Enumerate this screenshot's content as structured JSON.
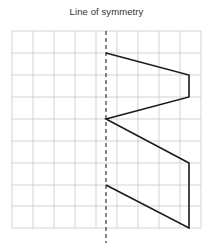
{
  "title": "Line of symmetry",
  "colors": {
    "grid": "#c8c8c8",
    "shape": "#1a1a1a",
    "symmetry_line": "#222222",
    "background": "#ffffff",
    "title_text": "#333333"
  },
  "chart_data": {
    "type": "scatter",
    "title": "Line of symmetry",
    "xlabel": "",
    "ylabel": "",
    "grid": true,
    "legend": null,
    "grid_spec": {
      "origin_x": 12,
      "origin_y": 31,
      "cell_width": 21,
      "cell_height": 21.9,
      "columns": 9,
      "rows": 9,
      "right_edge": 201,
      "bottom_edge": 228
    },
    "symmetry_line": {
      "orientation": "vertical",
      "x": 106,
      "y_top": 31,
      "y_bottom": 243,
      "style": "dashed",
      "label": "Line of symmetry"
    },
    "shape": {
      "name": "half-arrow-polyline",
      "closed": false,
      "stroke_width": 1.6,
      "points": [
        [
          106,
          53
        ],
        [
          189,
          75
        ],
        [
          189,
          97
        ],
        [
          106,
          119
        ],
        [
          189,
          163
        ],
        [
          189,
          228
        ],
        [
          106,
          185
        ]
      ],
      "segments": [
        {
          "from": [
            106,
            53
          ],
          "to": [
            189,
            75
          ]
        },
        {
          "from": [
            189,
            75
          ],
          "to": [
            189,
            97
          ]
        },
        {
          "from": [
            189,
            97
          ],
          "to": [
            106,
            119
          ]
        },
        {
          "from": [
            106,
            119
          ],
          "to": [
            189,
            163
          ]
        },
        {
          "from": [
            189,
            163
          ],
          "to": [
            189,
            228
          ]
        },
        {
          "from": [
            189,
            228
          ],
          "to": [
            106,
            185
          ]
        }
      ]
    },
    "grid_lines_vertical": [
      12,
      33,
      54,
      75,
      96,
      117,
      138,
      159,
      180,
      201
    ],
    "grid_lines_horizontal": [
      31,
      53,
      75,
      97,
      119,
      141,
      163,
      185,
      206,
      228
    ]
  }
}
